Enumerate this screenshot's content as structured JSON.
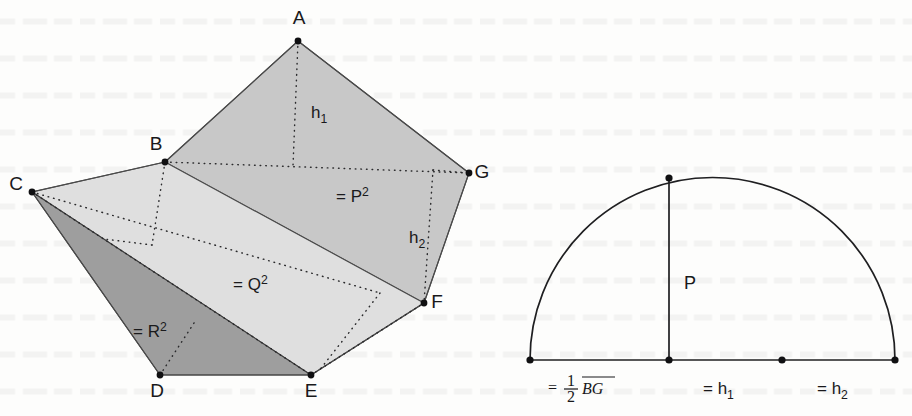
{
  "figure": {
    "caption_present": false,
    "background_color": "#fdfdfc",
    "ink_color": "#1a1a1c"
  },
  "left_diagram": {
    "name": "pentagon-dissection",
    "fills": {
      "p_region": "#c9c9c9",
      "q_region": "#dedede",
      "r_region": "#9d9d9d"
    },
    "vertices": [
      {
        "id": "A",
        "label": "A",
        "x": 298,
        "y": 41,
        "label_x": 299,
        "label_y": 24
      },
      {
        "id": "B",
        "label": "B",
        "x": 165,
        "y": 162,
        "label_x": 156,
        "label_y": 150
      },
      {
        "id": "C",
        "label": "C",
        "x": 32,
        "y": 192,
        "label_x": 16,
        "label_y": 190
      },
      {
        "id": "D",
        "label": "D",
        "x": 160,
        "y": 375,
        "label_x": 157,
        "label_y": 397
      },
      {
        "id": "E",
        "label": "E",
        "x": 311,
        "y": 375,
        "label_x": 311,
        "label_y": 397
      },
      {
        "id": "F",
        "label": "F",
        "x": 424,
        "y": 303,
        "label_x": 437,
        "label_y": 307
      },
      {
        "id": "G",
        "label": "G",
        "x": 469,
        "y": 173,
        "label_x": 482,
        "label_y": 177
      }
    ],
    "area_labels": [
      {
        "id": "P",
        "prefix": "= P",
        "exponent": "2",
        "x": 336,
        "y": 202
      },
      {
        "id": "Q",
        "prefix": "= Q",
        "exponent": "2",
        "x": 233,
        "y": 290
      },
      {
        "id": "R",
        "prefix": "= R",
        "exponent": "2",
        "x": 133,
        "y": 337
      }
    ],
    "height_labels": [
      {
        "id": "h1",
        "base": "h",
        "sub": "1",
        "x": 311,
        "y": 118
      },
      {
        "id": "h2",
        "base": "h",
        "sub": "2",
        "x": 409,
        "y": 243
      }
    ]
  },
  "right_diagram": {
    "name": "semicircle-construction",
    "baseline": {
      "y": 360,
      "x_start": 530,
      "x_end": 895
    },
    "semicircle": {
      "center_x": 712.5,
      "center_y": 360,
      "radius": 182.5
    },
    "altitude": {
      "label": "P",
      "x": 669,
      "y_top": 178,
      "y_bottom": 360,
      "label_x": 684,
      "label_y": 282
    },
    "baseline_points": [
      {
        "id": "left-end",
        "x": 530
      },
      {
        "id": "foot-of-P",
        "x": 669
      },
      {
        "id": "mid-mark",
        "x": 782
      },
      {
        "id": "right-end",
        "x": 895
      }
    ],
    "segment_labels": [
      {
        "id": "half-BG",
        "equals": "=",
        "fraction_num": "1",
        "fraction_den": "2",
        "overline": "BG",
        "x": 578,
        "y": 390
      },
      {
        "id": "h1",
        "base": "= h",
        "sub": "1",
        "x": 703,
        "y": 390
      },
      {
        "id": "h2",
        "base": "= h",
        "sub": "2",
        "x": 817,
        "y": 390
      }
    ]
  }
}
